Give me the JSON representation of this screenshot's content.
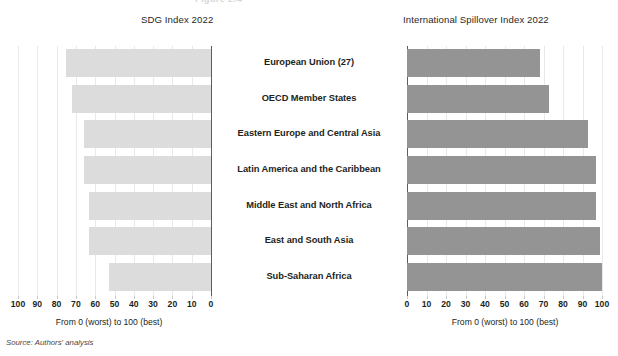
{
  "figure": {
    "cutoff_header": "Figure 2.4",
    "source_note": "Source: Authors' analysis"
  },
  "left_panel": {
    "title": "SDG Index 2022",
    "axis_caption": "From 0 (worst) to 100 (best)",
    "tick_labels": [
      "100",
      "90",
      "80",
      "70",
      "60",
      "50",
      "40",
      "30",
      "20",
      "10",
      "0"
    ]
  },
  "right_panel": {
    "title": "International Spillover Index 2022",
    "axis_caption": "From 0 (worst) to 100 (best)",
    "tick_labels": [
      "0",
      "10",
      "20",
      "30",
      "40",
      "50",
      "60",
      "70",
      "80",
      "90",
      "100"
    ]
  },
  "categories": [
    "European Union (27)",
    "OECD Member States",
    "Eastern Europe and Central Asia",
    "Latin America and the Caribbean",
    "Middle East and North Africa",
    "East and South Asia",
    "Sub-Saharan Africa"
  ],
  "colors": {
    "left_bar": "#dcdcdc",
    "right_bar": "#949494",
    "axis": "#5d5d5d",
    "gridline": "#e9e9e9",
    "text": "#231f20"
  },
  "chart_data": [
    {
      "type": "bar",
      "orientation": "horizontal",
      "title": "SDG Index 2022",
      "xlabel": "From 0 (worst) to 100 (best)",
      "ylabel": "",
      "xlim": [
        100,
        0
      ],
      "x_axis_reversed": true,
      "grid": true,
      "legend": "none",
      "xticks": [
        100,
        90,
        80,
        70,
        60,
        50,
        40,
        30,
        20,
        10,
        0
      ],
      "categories": [
        "European Union (27)",
        "OECD Member States",
        "Eastern Europe and Central Asia",
        "Latin America and the Caribbean",
        "Middle East and North Africa",
        "East and South Asia",
        "Sub-Saharan Africa"
      ],
      "values": [
        75,
        72,
        66,
        66,
        63,
        63,
        53
      ],
      "bar_color": "#dcdcdc"
    },
    {
      "type": "bar",
      "orientation": "horizontal",
      "title": "International Spillover Index 2022",
      "xlabel": "From 0 (worst) to 100 (best)",
      "ylabel": "",
      "xlim": [
        0,
        100
      ],
      "x_axis_reversed": false,
      "grid": true,
      "legend": "none",
      "xticks": [
        0,
        10,
        20,
        30,
        40,
        50,
        60,
        70,
        80,
        90,
        100
      ],
      "categories": [
        "European Union (27)",
        "OECD Member States",
        "Eastern Europe and Central Asia",
        "Latin America and the Caribbean",
        "Middle East and North Africa",
        "East and South Asia",
        "Sub-Saharan Africa"
      ],
      "values": [
        68,
        73,
        93,
        97,
        97,
        99,
        100
      ],
      "bar_color": "#949494"
    }
  ]
}
